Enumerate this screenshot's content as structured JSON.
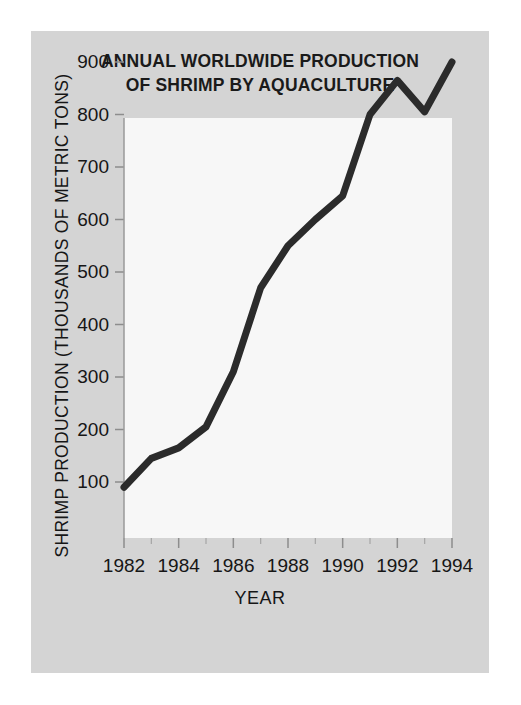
{
  "figure": {
    "title_line1": "ANNUAL WORLDWIDE PRODUCTION",
    "title_line2": "OF SHRIMP BY AQUACULTURE",
    "background_color": "#d4d4d4",
    "plot_background_color": "#f7f7f7",
    "line_color": "#2b2b2b",
    "text_color": "#161616"
  },
  "chart_data": {
    "type": "line",
    "title": "ANNUAL WORLDWIDE PRODUCTION OF SHRIMP BY AQUACULTURE",
    "xlabel": "YEAR",
    "ylabel": "SHRIMP PRODUCTION (THOUSANDS OF METRIC TONS)",
    "x": [
      1982,
      1983,
      1984,
      1985,
      1986,
      1987,
      1988,
      1989,
      1990,
      1991,
      1992,
      1993,
      1994
    ],
    "values": [
      90,
      145,
      165,
      205,
      310,
      470,
      550,
      600,
      645,
      800,
      865,
      805,
      900
    ],
    "series": [
      {
        "name": "Shrimp production",
        "values": [
          90,
          145,
          165,
          205,
          310,
          470,
          550,
          600,
          645,
          800,
          865,
          805,
          900
        ]
      }
    ],
    "xlim": [
      1982,
      1994
    ],
    "ylim": [
      0,
      950
    ],
    "xticks": [
      1982,
      1984,
      1986,
      1988,
      1990,
      1992,
      1994
    ],
    "xtick_labels": [
      "1982",
      "1984",
      "1986",
      "1988",
      "1990",
      "1992",
      "1994"
    ],
    "xminor_ticks": [
      1983,
      1985,
      1987,
      1989,
      1991,
      1993
    ],
    "yticks": [
      100,
      200,
      300,
      400,
      500,
      600,
      700,
      800,
      900
    ],
    "ytick_labels": [
      "100",
      "200",
      "300",
      "400",
      "500",
      "600",
      "700",
      "800",
      "900"
    ],
    "grid": false,
    "legend": false,
    "line_color": "#2b2b2b",
    "line_width": 7
  }
}
